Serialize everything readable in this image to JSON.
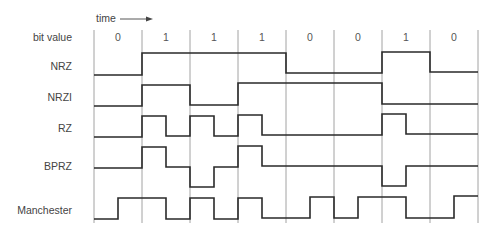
{
  "diagram": {
    "title_axis": "time",
    "bit_row_label": "bit value",
    "bits": [
      "0",
      "1",
      "1",
      "1",
      "0",
      "0",
      "1",
      "0"
    ],
    "encodings": [
      {
        "name": "NRZ",
        "levels": "binary"
      },
      {
        "name": "NRZI",
        "levels": "binary"
      },
      {
        "name": "RZ",
        "levels": "binary"
      },
      {
        "name": "BPRZ",
        "levels": "ternary"
      },
      {
        "name": "Manchester",
        "levels": "binary"
      }
    ],
    "colors": {
      "line": "#2a2a2a",
      "grid": "#8a8a8a",
      "text": "#444444"
    }
  }
}
